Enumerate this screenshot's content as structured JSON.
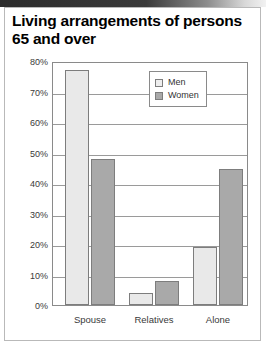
{
  "figure": {
    "title": "Living arrangements of persons 65 and over"
  },
  "legend": {
    "position": "top-right",
    "items": [
      {
        "label": "Men",
        "swatch": "legend-swatch-men",
        "color": "#eeeeee"
      },
      {
        "label": "Women",
        "swatch": "legend-swatch-women",
        "color": "#a9a9a9"
      }
    ]
  },
  "axes": {
    "y_ticks": [
      "0%",
      "10%",
      "20%",
      "30%",
      "40%",
      "50%",
      "60%",
      "70%",
      "80%"
    ],
    "x_ticks": [
      "Spouse",
      "Relatives",
      "Alone"
    ]
  },
  "chart_data": {
    "type": "bar",
    "title": "Living arrangements of persons 65 and over",
    "xlabel": "",
    "ylabel": "",
    "categories": [
      "Spouse",
      "Relatives",
      "Alone"
    ],
    "series": [
      {
        "name": "Men",
        "color": "#e9e9e9",
        "values": [
          77,
          4,
          19
        ]
      },
      {
        "name": "Women",
        "color": "#a9a9a9",
        "values": [
          48,
          8,
          44.5
        ]
      }
    ],
    "ylim": [
      0,
      80
    ],
    "ytick_step": 10,
    "ytick_format": "percent",
    "grid": true,
    "legend_position": "top-right"
  }
}
